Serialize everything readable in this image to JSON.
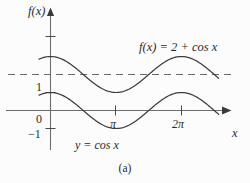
{
  "figure": {
    "caption": "(a)",
    "axis_label_y": "f(x)",
    "axis_label_x": "x",
    "background": "#fcfcfc"
  },
  "labels": {
    "curve_upper": "f(x) = 2 + cos x",
    "curve_lower": "y = cos x"
  },
  "ticks": {
    "y": [
      "1",
      "0",
      "−1"
    ],
    "x": [
      "π",
      "2π"
    ]
  },
  "colors": {
    "curve": "#3c3c3c",
    "axis": "#6e6e6e",
    "dashed": "#6a6a6a",
    "text": "#2b2b2b"
  },
  "chart_data": {
    "type": "line",
    "title": "",
    "xlabel": "x",
    "ylabel": "f(x)",
    "xlim": [
      -0.6,
      8.1
    ],
    "ylim": [
      -1.6,
      3.6
    ],
    "grid": false,
    "legend": "inline-annotations",
    "xticks": [
      3.14159,
      6.28319
    ],
    "xticklabels": [
      "π",
      "2π"
    ],
    "yticks": [
      -1,
      0,
      1,
      3
    ],
    "yticklabels": [
      "−1",
      "0",
      "1",
      ""
    ],
    "annotations": [
      {
        "text": "f(x) = 2 + cos x",
        "x": 4.6,
        "y": 3.05
      },
      {
        "text": "y = cos x",
        "x": 1.8,
        "y": -1.55
      }
    ],
    "reference_lines": [
      {
        "y": 2,
        "style": "dashed",
        "label": ""
      }
    ],
    "series": [
      {
        "name": "f(x) = 2 + cos x",
        "formula": "2 + cos(x)",
        "style": "solid",
        "x": [
          -0.55,
          0,
          1.5708,
          3.14159,
          4.71239,
          6.28319,
          7.9
        ],
        "values": [
          2.85,
          3,
          2,
          1,
          2,
          3,
          2.02
        ]
      },
      {
        "name": "y = cos x",
        "formula": "cos(x)",
        "style": "solid",
        "x": [
          -0.55,
          0,
          1.5708,
          3.14159,
          4.71239,
          6.28319,
          7.9
        ],
        "values": [
          0.85,
          1,
          0,
          -1,
          0,
          1,
          0.02
        ]
      }
    ]
  }
}
